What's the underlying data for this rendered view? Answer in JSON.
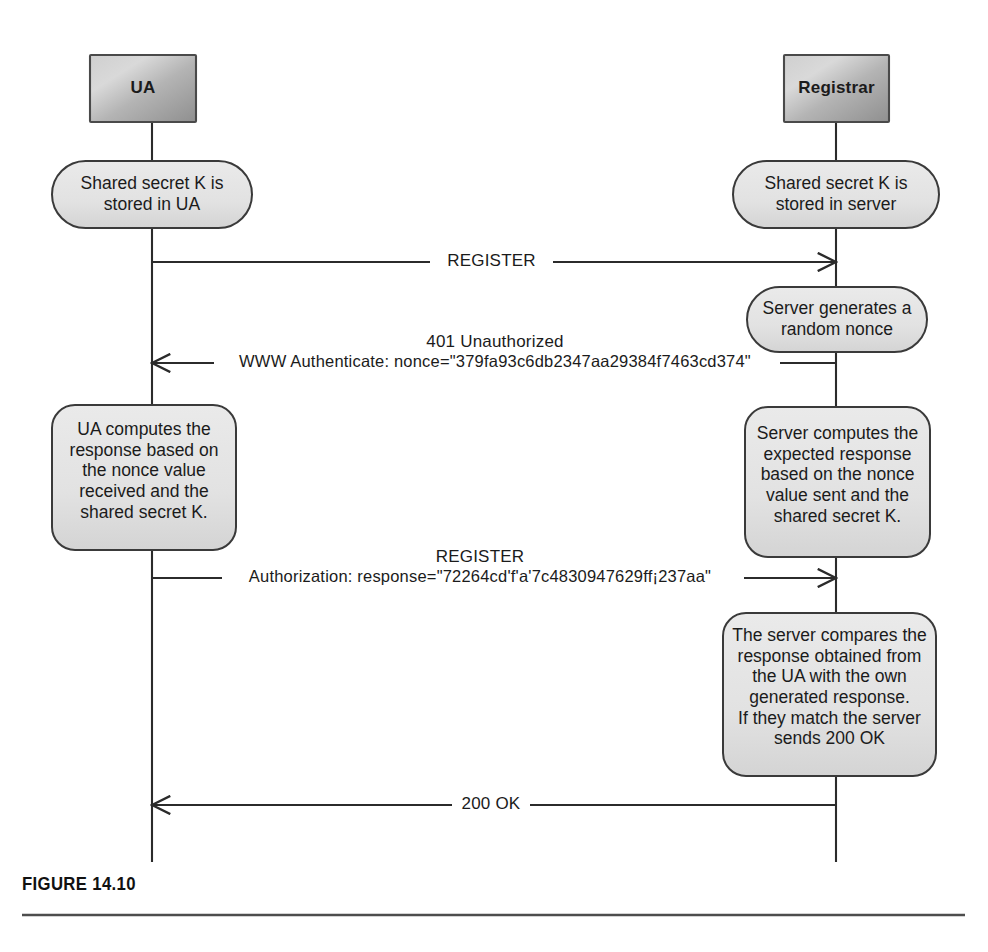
{
  "figure": {
    "caption": "FIGURE 14.10",
    "domain_kind": "uml-sequence-diagram"
  },
  "colors": {
    "line": "#2b2b2b",
    "actor_box_fill_light": "#d8d8d8",
    "actor_box_fill_dark": "#9a9a9a",
    "actor_box_stroke": "#4a4a4a",
    "note_fill": "#e3e3e3",
    "note_stroke": "#3a3a3a",
    "text": "#1b1b1b",
    "caption": "#111111",
    "rule": "#4d4d4d",
    "page_background": "#ffffff"
  },
  "actors": [
    {
      "id": "ua",
      "label": "UA",
      "lifeline_x": 152
    },
    {
      "id": "registrar",
      "label": "Registrar",
      "lifeline_x": 836
    }
  ],
  "notes": [
    {
      "id": "note-ua-shared-secret",
      "actor": "ua",
      "shape": "stadium",
      "lines": [
        "Shared secret K is",
        "stored in UA"
      ]
    },
    {
      "id": "note-server-shared-secret",
      "actor": "registrar",
      "shape": "stadium",
      "lines": [
        "Shared secret K is",
        "stored in server"
      ]
    },
    {
      "id": "note-server-nonce",
      "actor": "registrar",
      "shape": "stadium",
      "lines": [
        "Server generates a",
        "random nonce"
      ]
    },
    {
      "id": "note-ua-computes",
      "actor": "ua",
      "shape": "rounded-rect",
      "lines": [
        "UA computes the",
        "response based on",
        "the nonce value",
        "received and the",
        "shared secret K."
      ]
    },
    {
      "id": "note-server-computes",
      "actor": "registrar",
      "shape": "rounded-rect",
      "lines": [
        "Server computes the",
        "expected response",
        "based on the nonce",
        "value sent and the",
        "shared secret K."
      ]
    },
    {
      "id": "note-server-compares",
      "actor": "registrar",
      "shape": "rounded-rect",
      "lines": [
        "The server compares the",
        "response obtained from",
        "the UA with the own",
        "generated response.",
        "If they match the server",
        "sends 200 OK"
      ]
    }
  ],
  "messages": [
    {
      "id": "msg-register-1",
      "direction": "ua-to-registrar",
      "lines": [
        "REGISTER"
      ],
      "label_inline": true
    },
    {
      "id": "msg-401-unauthorized",
      "direction": "registrar-to-ua",
      "lines": [
        "401 Unauthorized",
        "WWW Authenticate: nonce=\"379fa93c6db2347aa29384f7463cd374\""
      ],
      "label_inline": false
    },
    {
      "id": "msg-register-2",
      "direction": "ua-to-registrar",
      "lines": [
        "REGISTER",
        "Authorization: response=\"72264cd'f'a'7c4830947629ff¡237aa\""
      ],
      "label_inline": false
    },
    {
      "id": "msg-200-ok",
      "direction": "registrar-to-ua",
      "lines": [
        "200 OK"
      ],
      "label_inline": true
    }
  ]
}
